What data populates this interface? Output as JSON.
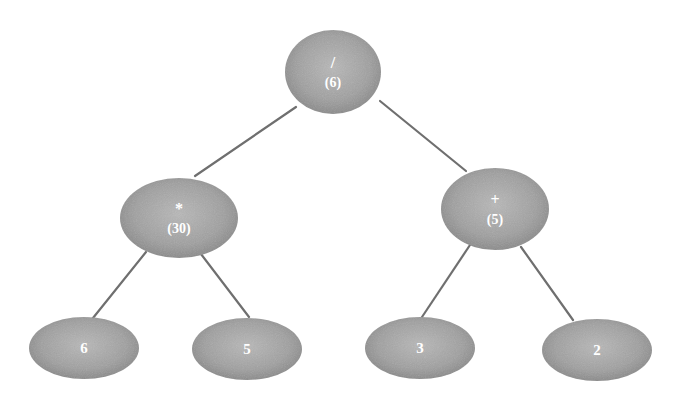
{
  "diagram": {
    "type": "expression-tree",
    "colors": {
      "background": "#ffffff",
      "node_fill_center": "#b4b4b4",
      "node_fill_edge": "#8a8a8a",
      "edge": "#6f6f6f",
      "label": "#ffffff"
    },
    "nodes": [
      {
        "id": "root",
        "op": "/",
        "value": "(6)",
        "cx": 333,
        "cy": 72,
        "rx": 48,
        "ry": 42
      },
      {
        "id": "mul",
        "op": "*",
        "value": "(30)",
        "cx": 179,
        "cy": 218,
        "rx": 59,
        "ry": 40
      },
      {
        "id": "add",
        "op": "+",
        "value": "(5)",
        "cx": 495,
        "cy": 209,
        "rx": 54,
        "ry": 41
      },
      {
        "id": "leaf6",
        "op": "6",
        "value": "",
        "cx": 84,
        "cy": 348,
        "rx": 55,
        "ry": 31
      },
      {
        "id": "leaf5",
        "op": "5",
        "value": "",
        "cx": 247,
        "cy": 349,
        "rx": 55,
        "ry": 31
      },
      {
        "id": "leaf3",
        "op": "3",
        "value": "",
        "cx": 420,
        "cy": 348,
        "rx": 55,
        "ry": 31
      },
      {
        "id": "leaf2",
        "op": "2",
        "value": "",
        "cx": 597,
        "cy": 350,
        "rx": 55,
        "ry": 31
      }
    ],
    "edges": [
      {
        "from": "root",
        "to": "mul",
        "x1": 296,
        "y1": 107,
        "x2": 195,
        "y2": 176
      },
      {
        "from": "root",
        "to": "add",
        "x1": 380,
        "y1": 101,
        "x2": 466,
        "y2": 171
      },
      {
        "from": "mul",
        "to": "leaf6",
        "x1": 146,
        "y1": 252,
        "x2": 93,
        "y2": 318
      },
      {
        "from": "mul",
        "to": "leaf5",
        "x1": 201,
        "y1": 254,
        "x2": 249,
        "y2": 317
      },
      {
        "from": "add",
        "to": "leaf3",
        "x1": 470,
        "y1": 245,
        "x2": 422,
        "y2": 317
      },
      {
        "from": "add",
        "to": "leaf2",
        "x1": 521,
        "y1": 247,
        "x2": 573,
        "y2": 320
      }
    ]
  }
}
